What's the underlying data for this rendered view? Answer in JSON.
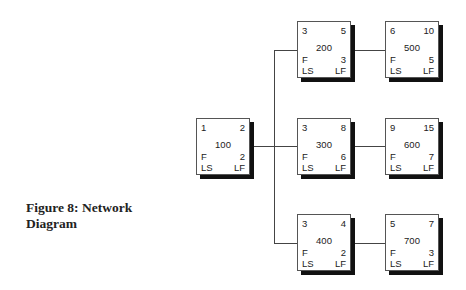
{
  "caption": {
    "line1": "Figure 8: Network",
    "line2": "Diagram"
  },
  "legend_labels": {
    "float": "F",
    "late_start": "LS",
    "late_finish": "LF"
  },
  "nodes": [
    {
      "id": "100",
      "early_start": "1",
      "early_finish": "2",
      "duration": "2",
      "f": "F",
      "ls": "LS",
      "lf": "LF"
    },
    {
      "id": "200",
      "early_start": "3",
      "early_finish": "5",
      "duration": "3",
      "f": "F",
      "ls": "LS",
      "lf": "LF"
    },
    {
      "id": "300",
      "early_start": "3",
      "early_finish": "8",
      "duration": "6",
      "f": "F",
      "ls": "LS",
      "lf": "LF"
    },
    {
      "id": "400",
      "early_start": "3",
      "early_finish": "4",
      "duration": "2",
      "f": "F",
      "ls": "LS",
      "lf": "LF"
    },
    {
      "id": "500",
      "early_start": "6",
      "early_finish": "10",
      "duration": "5",
      "f": "F",
      "ls": "LS",
      "lf": "LF"
    },
    {
      "id": "600",
      "early_start": "9",
      "early_finish": "15",
      "duration": "7",
      "f": "F",
      "ls": "LS",
      "lf": "LF"
    },
    {
      "id": "700",
      "early_start": "5",
      "early_finish": "7",
      "duration": "3",
      "f": "F",
      "ls": "LS",
      "lf": "LF"
    }
  ],
  "edges": [
    {
      "from": "100",
      "to": "200"
    },
    {
      "from": "100",
      "to": "300"
    },
    {
      "from": "100",
      "to": "400"
    },
    {
      "from": "200",
      "to": "500"
    },
    {
      "from": "300",
      "to": "600"
    },
    {
      "from": "400",
      "to": "700"
    }
  ]
}
